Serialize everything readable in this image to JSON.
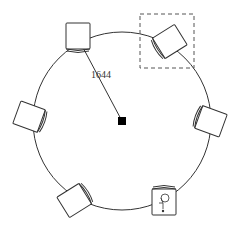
{
  "drawing": {
    "table": {
      "shape": "circle",
      "cx": 122,
      "cy": 121,
      "r": 89,
      "stroke": "#333333"
    },
    "center_marker": {
      "x": 122,
      "y": 121,
      "size": 8,
      "fill": "#000000"
    },
    "dimension": {
      "label": "1644",
      "x1": 122,
      "y1": 121,
      "x2": 80,
      "y2": 42,
      "label_x": 91,
      "label_y": 78
    },
    "chairs": [
      {
        "id": "chair-top-left",
        "cx": 78,
        "cy": 37,
        "angle": 0,
        "selected": false,
        "has_accessibility_icon": false
      },
      {
        "id": "chair-top-right",
        "cx": 169,
        "cy": 42,
        "angle": 58,
        "selected": true,
        "has_accessibility_icon": false
      },
      {
        "id": "chair-right",
        "cx": 210,
        "cy": 121,
        "angle": 110,
        "selected": false,
        "has_accessibility_icon": false
      },
      {
        "id": "chair-bottom-right",
        "cx": 164,
        "cy": 201,
        "angle": 180,
        "selected": false,
        "has_accessibility_icon": true
      },
      {
        "id": "chair-bottom-left",
        "cx": 75,
        "cy": 200,
        "angle": 238,
        "selected": false,
        "has_accessibility_icon": false
      },
      {
        "id": "chair-left",
        "cx": 30,
        "cy": 117,
        "angle": 290,
        "selected": false,
        "has_accessibility_icon": false
      }
    ],
    "selection_box": {
      "x": 140,
      "y": 14,
      "w": 54,
      "h": 54,
      "dash": "4,3"
    },
    "accessibility_icon_name": "wheelchair-icon",
    "colors": {
      "line": "#333333",
      "background": "#ffffff"
    }
  }
}
